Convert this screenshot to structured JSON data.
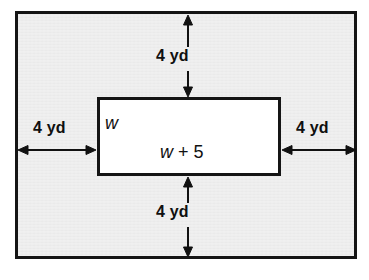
{
  "diagram": {
    "outer_region": {
      "name": "shaded-border-region",
      "fill_color": "#ececec",
      "stroke_color": "#151515"
    },
    "inner_rectangle": {
      "name": "inner-white-rectangle",
      "fill_color": "#ffffff",
      "stroke_color": "#151515",
      "width_label": "w + 5",
      "width_label_variable": "w",
      "width_label_rest": " + 5",
      "height_label": "w"
    },
    "dimensions": [
      {
        "id": "top",
        "label": "4 yd",
        "orientation": "vertical"
      },
      {
        "id": "right",
        "label": "4 yd",
        "orientation": "horizontal"
      },
      {
        "id": "bottom",
        "label": "4 yd",
        "orientation": "vertical"
      },
      {
        "id": "left",
        "label": "4 yd",
        "orientation": "horizontal"
      }
    ],
    "units": "yd",
    "border_width_value": 4
  }
}
